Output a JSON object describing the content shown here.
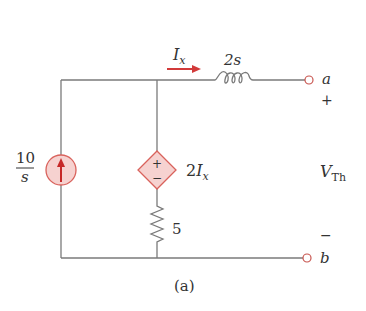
{
  "diagram": {
    "type": "circuit",
    "caption": "(a)",
    "colors": {
      "wire": "#7a7a7a",
      "accent": "#d23a3a",
      "source_fill": "#f6d2d0",
      "source_stroke": "#d9625c",
      "text": "#333333"
    },
    "components": {
      "current_source": {
        "label_num": "10",
        "label_den": "s",
        "direction": "up"
      },
      "dependent_source": {
        "label_coef": "2",
        "label_var": "I",
        "label_sub": "x",
        "plus": "+",
        "minus": "−"
      },
      "resistor": {
        "label": "5"
      },
      "inductor": {
        "label": "2s"
      },
      "current_arrow": {
        "label_var": "I",
        "label_sub": "x"
      }
    },
    "terminals": {
      "a": {
        "label": "a",
        "polarity": "+"
      },
      "b": {
        "label": "b",
        "polarity": "−"
      }
    },
    "output_voltage": {
      "label_var": "V",
      "label_sub": "Th"
    }
  }
}
